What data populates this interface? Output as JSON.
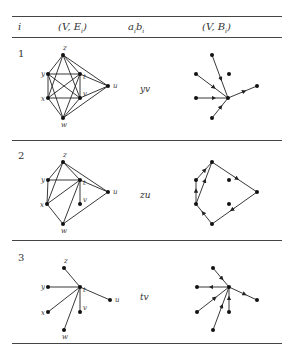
{
  "table": {
    "headers": [
      "i",
      "(V, E_i)",
      "a_i b_i",
      "(V, B_i)"
    ],
    "header_display": {
      "i": "i",
      "graph": "(V, E",
      "graph_sub": "i",
      "pair": "a",
      "pair_sub": "i",
      "pair_b": "b",
      "pair_b_sub": "i",
      "tree": "(V, B",
      "tree_sub": "i"
    },
    "rows": [
      {
        "i": "1",
        "pair": "yv",
        "graph": {
          "nodes": {
            "z": [
              63,
              55
            ],
            "y": [
              48,
              74
            ],
            "t": [
              80,
              74
            ],
            "u": [
              108,
              86
            ],
            "x": [
              48,
              98
            ],
            "v": [
              80,
              98
            ],
            "w": [
              63,
              118
            ]
          },
          "edges": [
            [
              "z",
              "y"
            ],
            [
              "z",
              "t"
            ],
            [
              "z",
              "x"
            ],
            [
              "z",
              "v"
            ],
            [
              "z",
              "u"
            ],
            [
              "y",
              "t"
            ],
            [
              "y",
              "x"
            ],
            [
              "y",
              "v"
            ],
            [
              "t",
              "x"
            ],
            [
              "t",
              "v"
            ],
            [
              "t",
              "u"
            ],
            [
              "x",
              "v"
            ],
            [
              "x",
              "w"
            ],
            [
              "v",
              "w"
            ],
            [
              "v",
              "u"
            ],
            [
              "w",
              "u"
            ],
            [
              "y",
              "w"
            ],
            [
              "t",
              "w"
            ]
          ]
        },
        "tree": {
          "nodes": {
            "z": [
              212,
              55
            ],
            "y": [
              196,
              74
            ],
            "t": [
              229,
              74
            ],
            "u": [
              257,
              86
            ],
            "x": [
              196,
              98
            ],
            "v": [
              228,
              98
            ],
            "w": [
              212,
              118
            ]
          },
          "arcs": [
            [
              "z",
              "v"
            ],
            [
              "y",
              "v"
            ],
            [
              "x",
              "v"
            ],
            [
              "v",
              "u"
            ],
            [
              "w",
              "v"
            ]
          ]
        }
      },
      {
        "i": "2",
        "pair": "zu",
        "graph": {
          "nodes": {
            "z": [
              63,
              162
            ],
            "y": [
              48,
              180
            ],
            "t": [
              80,
              180
            ],
            "u": [
              108,
              192
            ],
            "x": [
              47,
              204
            ],
            "v": [
              80,
              204
            ],
            "w": [
              63,
              224
            ]
          },
          "edges": [
            [
              "z",
              "y"
            ],
            [
              "z",
              "x"
            ],
            [
              "z",
              "t"
            ],
            [
              "z",
              "u"
            ],
            [
              "y",
              "t"
            ],
            [
              "y",
              "x"
            ],
            [
              "t",
              "x"
            ],
            [
              "t",
              "w"
            ],
            [
              "t",
              "v"
            ],
            [
              "t",
              "u"
            ],
            [
              "x",
              "w"
            ],
            [
              "w",
              "u"
            ]
          ]
        },
        "tree": {
          "nodes": {
            "z": [
              212,
              162
            ],
            "y": [
              196,
              180
            ],
            "t": [
              229,
              180
            ],
            "u": [
              257,
              192
            ],
            "x": [
              196,
              204
            ],
            "v": [
              229,
              204
            ],
            "w": [
              212,
              224
            ]
          },
          "arcs": [
            [
              "y",
              "z"
            ],
            [
              "x",
              "y"
            ],
            [
              "x",
              "z"
            ],
            [
              "z",
              "u"
            ],
            [
              "w",
              "x"
            ],
            [
              "u",
              "w"
            ]
          ]
        }
      },
      {
        "i": "3",
        "pair": "tv",
        "graph": {
          "nodes": {
            "z": [
              64,
              268
            ],
            "y": [
              48,
              287
            ],
            "t": [
              80,
              287
            ],
            "u": [
              110,
              300
            ],
            "x": [
              48,
              312
            ],
            "v": [
              80,
              312
            ],
            "w": [
              64,
              330
            ]
          },
          "edges": [
            [
              "t",
              "z"
            ],
            [
              "t",
              "y"
            ],
            [
              "t",
              "u"
            ],
            [
              "t",
              "x"
            ],
            [
              "t",
              "v"
            ],
            [
              "t",
              "w"
            ]
          ]
        },
        "tree": {
          "nodes": {
            "z": [
              213,
              268
            ],
            "y": [
              197,
              287
            ],
            "t": [
              229,
              287
            ],
            "u": [
              257,
              300
            ],
            "x": [
              197,
              312
            ],
            "v": [
              229,
              312
            ],
            "w": [
              213,
              330
            ]
          },
          "arcs": [
            [
              "z",
              "t"
            ],
            [
              "t",
              "y"
            ],
            [
              "t",
              "u"
            ],
            [
              "x",
              "t"
            ],
            [
              "v",
              "t"
            ],
            [
              "w",
              "t"
            ]
          ]
        }
      }
    ]
  }
}
